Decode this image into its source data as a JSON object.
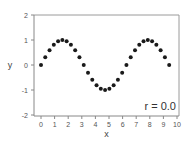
{
  "chart_data": {
    "type": "scatter",
    "title": "",
    "xlabel": "x",
    "ylabel": "y",
    "xlim": [
      0,
      10
    ],
    "ylim": [
      -2,
      2
    ],
    "xticks": [
      "0",
      "1",
      "2",
      "3",
      "4",
      "5",
      "6",
      "7",
      "8",
      "9",
      "10"
    ],
    "yticks": [
      "2",
      "1",
      "0",
      "-1",
      "-2"
    ],
    "grid": false,
    "legend": null,
    "annotation": "r = 0.0",
    "series": [
      {
        "name": "y = sin(x)",
        "x": [
          0.0,
          0.314,
          0.628,
          0.942,
          1.257,
          1.571,
          1.885,
          2.199,
          2.513,
          2.827,
          3.142,
          3.456,
          3.77,
          4.084,
          4.398,
          4.712,
          5.027,
          5.341,
          5.655,
          5.969,
          6.283,
          6.597,
          6.912,
          7.226,
          7.54,
          7.854,
          8.168,
          8.482,
          8.796,
          9.111,
          9.425
        ],
        "y": [
          0.0,
          0.31,
          0.59,
          0.81,
          0.95,
          1.0,
          0.95,
          0.81,
          0.59,
          0.31,
          0.0,
          -0.31,
          -0.59,
          -0.81,
          -0.95,
          -1.0,
          -0.95,
          -0.81,
          -0.59,
          -0.31,
          0.0,
          0.31,
          0.59,
          0.81,
          0.95,
          1.0,
          0.95,
          0.81,
          0.59,
          0.31,
          0.0
        ]
      }
    ]
  }
}
